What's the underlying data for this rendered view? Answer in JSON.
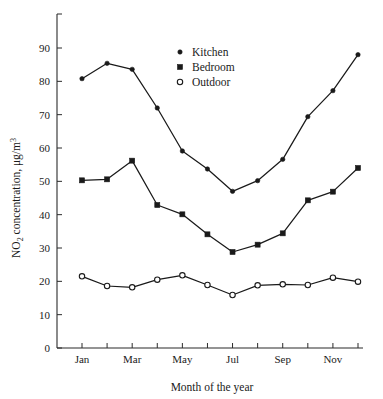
{
  "figure": {
    "background_color": "#ffffff",
    "ink_color": "#1a1a1a"
  },
  "axes": {
    "x_title": "Month of the year",
    "y_title_prefix": "NO",
    "y_title_sub": "2",
    "y_title_mid": " concentration, μg/m",
    "y_title_sup": "3",
    "y_title_full": "NO2 concentration, μg/m3",
    "y_ticks": [
      "0",
      "10",
      "20",
      "30",
      "40",
      "50",
      "60",
      "70",
      "80",
      "90"
    ],
    "x_tick_labels": [
      "Jan",
      "Mar",
      "May",
      "Jul",
      "Sep",
      "Nov"
    ]
  },
  "legend": {
    "entries": [
      {
        "label": "Kitchen",
        "marker": "filled-circle"
      },
      {
        "label": "Bedroom",
        "marker": "filled-square"
      },
      {
        "label": "Outdoor",
        "marker": "open-circle"
      }
    ]
  },
  "chart_data": {
    "type": "line",
    "title": "",
    "subtitle": "",
    "xlabel": "Month of the year",
    "ylabel": "NO2 concentration, μg/m3",
    "categories": [
      "Jan",
      "Feb",
      "Mar",
      "Apr",
      "May",
      "Jun",
      "Jul",
      "Aug",
      "Sep",
      "Oct",
      "Nov",
      "Dec"
    ],
    "xlim": [
      0.5,
      12.5
    ],
    "ylim": [
      0,
      97
    ],
    "ytick_values": [
      0,
      10,
      20,
      30,
      40,
      50,
      60,
      70,
      80,
      90
    ],
    "xtick_labeled_months": [
      "Jan",
      "Mar",
      "May",
      "Jul",
      "Sep",
      "Nov"
    ],
    "grid": false,
    "legend_position": "upper-center",
    "series": [
      {
        "name": "Kitchen",
        "marker": "filled-circle",
        "values": [
          80.8,
          85.4,
          83.6,
          72.0,
          59.1,
          53.7,
          47.0,
          50.2,
          56.6,
          69.4,
          77.2,
          88.0
        ]
      },
      {
        "name": "Bedroom",
        "marker": "filled-square",
        "values": [
          50.3,
          50.6,
          56.2,
          42.9,
          40.1,
          34.1,
          28.8,
          31.0,
          34.4,
          44.3,
          46.9,
          54.0
        ]
      },
      {
        "name": "Outdoor",
        "marker": "open-circle",
        "values": [
          21.5,
          18.6,
          18.2,
          20.5,
          21.8,
          18.9,
          15.9,
          18.8,
          19.1,
          18.9,
          21.1,
          19.9
        ]
      }
    ]
  }
}
